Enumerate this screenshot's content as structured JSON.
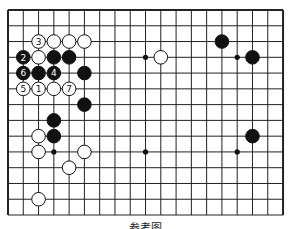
{
  "diagram": {
    "type": "go-board-partial",
    "caption": "参考图",
    "grid": {
      "columns": 19,
      "rows": 14,
      "origin_x": 8,
      "origin_y": 10,
      "spacing_x": 15.28,
      "spacing_y": 15.77,
      "line_color": "#222222",
      "edges": {
        "left": true,
        "top": true,
        "right": true,
        "bottom": false
      }
    },
    "star_points": [
      {
        "col": 3,
        "row": 3
      },
      {
        "col": 9,
        "row": 3
      },
      {
        "col": 15,
        "row": 3
      },
      {
        "col": 3,
        "row": 9
      },
      {
        "col": 9,
        "row": 9
      },
      {
        "col": 15,
        "row": 9
      }
    ],
    "stones": [
      {
        "color": "white",
        "col": 2,
        "row": 2,
        "label": "3"
      },
      {
        "color": "white",
        "col": 3,
        "row": 2,
        "label": ""
      },
      {
        "color": "white",
        "col": 4,
        "row": 2,
        "label": ""
      },
      {
        "color": "white",
        "col": 5,
        "row": 2,
        "label": ""
      },
      {
        "color": "black",
        "col": 1,
        "row": 3,
        "label": "2"
      },
      {
        "color": "white",
        "col": 2,
        "row": 3,
        "label": ""
      },
      {
        "color": "black",
        "col": 3,
        "row": 3,
        "label": ""
      },
      {
        "color": "black",
        "col": 4,
        "row": 3,
        "label": ""
      },
      {
        "color": "black",
        "col": 1,
        "row": 4,
        "label": "6"
      },
      {
        "color": "black",
        "col": 2,
        "row": 4,
        "label": ""
      },
      {
        "color": "black",
        "col": 3,
        "row": 4,
        "label": "4"
      },
      {
        "color": "black",
        "col": 5,
        "row": 4,
        "label": ""
      },
      {
        "color": "white",
        "col": 1,
        "row": 5,
        "label": "5"
      },
      {
        "color": "white",
        "col": 2,
        "row": 5,
        "label": "1"
      },
      {
        "color": "white",
        "col": 3,
        "row": 5,
        "label": ""
      },
      {
        "color": "white",
        "col": 4,
        "row": 5,
        "label": "7"
      },
      {
        "color": "black",
        "col": 5,
        "row": 6,
        "label": ""
      },
      {
        "color": "black",
        "col": 3,
        "row": 7,
        "label": ""
      },
      {
        "color": "white",
        "col": 2,
        "row": 8,
        "label": ""
      },
      {
        "color": "black",
        "col": 3,
        "row": 8,
        "label": ""
      },
      {
        "color": "white",
        "col": 2,
        "row": 9,
        "label": ""
      },
      {
        "color": "white",
        "col": 5,
        "row": 9,
        "label": ""
      },
      {
        "color": "white",
        "col": 4,
        "row": 10,
        "label": ""
      },
      {
        "color": "white",
        "col": 2,
        "row": 12,
        "label": ""
      },
      {
        "color": "white",
        "col": 10,
        "row": 3,
        "label": ""
      },
      {
        "color": "black",
        "col": 14,
        "row": 2,
        "label": ""
      },
      {
        "color": "black",
        "col": 16,
        "row": 3,
        "label": ""
      },
      {
        "color": "black",
        "col": 16,
        "row": 8,
        "label": ""
      }
    ]
  }
}
